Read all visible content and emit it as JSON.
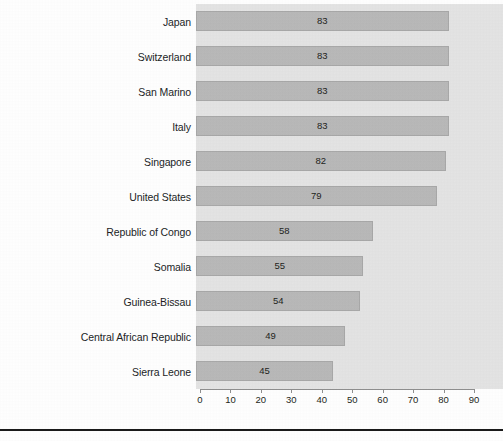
{
  "chart_data": {
    "type": "bar",
    "orientation": "horizontal",
    "title": "",
    "xlabel": "",
    "ylabel": "",
    "xlim": [
      0,
      90
    ],
    "xticks": [
      0,
      10,
      20,
      30,
      40,
      50,
      60,
      70,
      80,
      90
    ],
    "grid": false,
    "legend": null,
    "categories": [
      "Japan",
      "Switzerland",
      "San Marino",
      "Italy",
      "Singapore",
      "United States",
      "Republic of Congo",
      "Somalia",
      "Guinea-Bissau",
      "Central African Republic",
      "Sierra Leone"
    ],
    "values": [
      83,
      83,
      83,
      83,
      82,
      79,
      58,
      55,
      54,
      49,
      45
    ],
    "data_labels": [
      "83",
      "83",
      "83",
      "83",
      "82",
      "79",
      "58",
      "55",
      "54",
      "49",
      "45"
    ],
    "colors": {
      "bar_fill": "#b9b9b9",
      "bar_border": "#a8a8a8",
      "plot_background": "#e4e4e4",
      "axis_line": "#8f8f8f",
      "text": "#231f20",
      "page_background": "#ffffff",
      "rule": "#1a1a1a"
    }
  },
  "footer": {
    "rule_visible": true,
    "caption": ""
  }
}
